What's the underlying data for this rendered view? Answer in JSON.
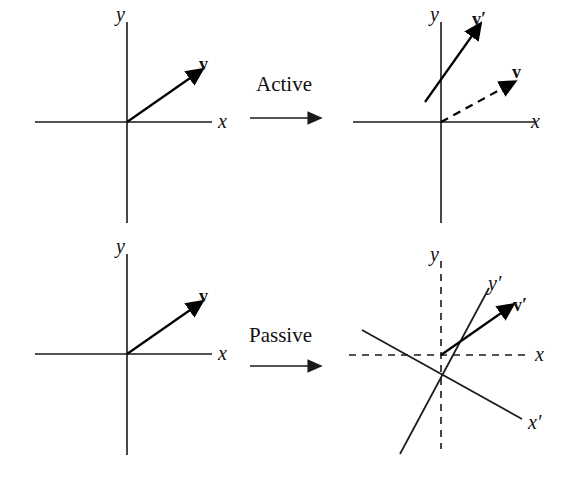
{
  "figure": {
    "width": 572,
    "height": 481,
    "background": "#ffffff",
    "ink_color": "#1a1a1a"
  },
  "operations": [
    {
      "id": "active",
      "label": "Active",
      "x": 256,
      "y": 74
    },
    {
      "id": "passive",
      "label": "Passive",
      "x": 249,
      "y": 325
    }
  ],
  "panels": [
    {
      "id": "top-left",
      "role": "original-frame-active",
      "origin": {
        "x": 127,
        "y": 122
      },
      "axes": [
        {
          "name": "x",
          "label": "x",
          "style": "solid",
          "label_x": 218,
          "label_y": 111
        },
        {
          "name": "y",
          "label": "y",
          "style": "solid",
          "label_x": 116,
          "label_y": 4
        }
      ],
      "vectors": [
        {
          "name": "v",
          "label": "v",
          "style": "solid",
          "label_x": 199,
          "label_y": 55,
          "angle_deg": 35
        }
      ]
    },
    {
      "id": "top-right",
      "role": "rotated-vector-active",
      "origin": {
        "x": 441,
        "y": 122
      },
      "axes": [
        {
          "name": "x",
          "label": "x",
          "style": "solid",
          "label_x": 531,
          "label_y": 111
        },
        {
          "name": "y",
          "label": "y",
          "style": "solid",
          "label_x": 430,
          "label_y": 4
        }
      ],
      "vectors": [
        {
          "name": "v-prime",
          "label": "v′",
          "style": "solid",
          "label_x": 472,
          "label_y": 10,
          "angle_deg": 57
        },
        {
          "name": "v",
          "label": "v",
          "style": "dashed",
          "label_x": 512,
          "label_y": 63,
          "angle_deg": 28
        }
      ]
    },
    {
      "id": "bottom-left",
      "role": "original-frame-passive",
      "origin": {
        "x": 127,
        "y": 354
      },
      "axes": [
        {
          "name": "x",
          "label": "x",
          "style": "solid",
          "label_x": 218,
          "label_y": 343
        },
        {
          "name": "y",
          "label": "y",
          "style": "solid",
          "label_x": 116,
          "label_y": 236
        }
      ],
      "vectors": [
        {
          "name": "v",
          "label": "v",
          "style": "solid",
          "label_x": 199,
          "label_y": 287,
          "angle_deg": 35
        }
      ]
    },
    {
      "id": "bottom-right",
      "role": "rotated-frame-passive",
      "origin": {
        "x": 441,
        "y": 355
      },
      "axes": [
        {
          "name": "x",
          "label": "x",
          "style": "dashed",
          "label_x": 535,
          "label_y": 344
        },
        {
          "name": "y",
          "label": "y",
          "style": "dashed",
          "label_x": 430,
          "label_y": 244
        },
        {
          "name": "x-prime",
          "label": "x′",
          "style": "solid",
          "label_x": 528,
          "label_y": 412,
          "angle_deg": -28
        },
        {
          "name": "y-prime",
          "label": "y′",
          "style": "solid",
          "label_x": 488,
          "label_y": 273,
          "angle_deg": 62
        }
      ],
      "vectors": [
        {
          "name": "v-prime",
          "label": "v′",
          "style": "solid",
          "label_x": 513,
          "label_y": 296,
          "angle_deg": 35
        }
      ]
    }
  ]
}
